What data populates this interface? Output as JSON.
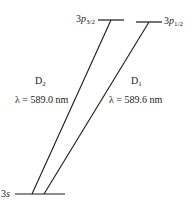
{
  "diagram": {
    "levels": [
      {
        "id": "3p32",
        "prefix": "3",
        "orbital": "p",
        "subscript": "3/2"
      },
      {
        "id": "3p12",
        "prefix": "3",
        "orbital": "p",
        "subscript": "1/2"
      },
      {
        "id": "3s",
        "prefix": "3",
        "orbital": "s",
        "subscript": ""
      }
    ],
    "transitions": [
      {
        "name": "D",
        "subscript": "2",
        "from": "3p32",
        "to": "3s",
        "wavelength_label": "λ = 589.0 nm",
        "wavelength_nm": 589.0
      },
      {
        "name": "D",
        "subscript": "1",
        "from": "3p12",
        "to": "3s",
        "wavelength_label": "λ = 589.6 nm",
        "wavelength_nm": 589.6
      }
    ],
    "line_color": "#1a1a1a"
  }
}
